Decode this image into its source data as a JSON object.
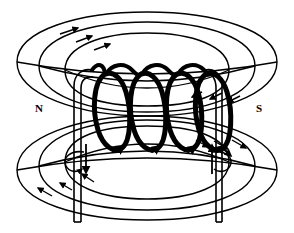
{
  "diagram": {
    "background_color": "#ffffff",
    "line_color": "#000000",
    "labels": {
      "north_pole": "N",
      "south_pole": "S"
    },
    "label_positions": {
      "north_pole": {
        "x": 39,
        "y": 112
      },
      "south_pole": {
        "x": 259,
        "y": 112
      }
    },
    "solenoid": {
      "turn_count": 4,
      "turn_centers_x": [
        114,
        150,
        186,
        222
      ],
      "turn_center_y": 112,
      "turn_rx": 17,
      "turn_ry": 41,
      "coil_stroke_width": 5,
      "core_rungs": 7
    },
    "leads": {
      "left_lead_x": 78,
      "right_lead_x": 219,
      "top_y": 72,
      "bottom_y": 222,
      "stroke_width": 2
    },
    "current_arrows": [
      {
        "name": "left-lead-current-arrow",
        "direction": "down",
        "x": 86,
        "y_start": 144,
        "y_end": 174
      },
      {
        "name": "right-lead-current-arrow",
        "direction": "up",
        "x": 212,
        "y_start": 174,
        "y_end": 144
      }
    ],
    "field_lines": {
      "upper_count": 3,
      "lower_count": 3,
      "upper_arrow_direction": "clockwise-right",
      "lower_arrow_direction": "counterclockwise-left",
      "upper_rings": [
        {
          "cx": 147,
          "cy": 62,
          "rx": 132,
          "ry": 52
        },
        {
          "cx": 147,
          "cy": 66,
          "rx": 108,
          "ry": 43
        },
        {
          "cx": 147,
          "cy": 70,
          "rx": 82,
          "ry": 33
        }
      ],
      "lower_rings": [
        {
          "cx": 147,
          "cy": 170,
          "rx": 132,
          "ry": 52
        },
        {
          "cx": 147,
          "cy": 166,
          "rx": 108,
          "ry": 43
        },
        {
          "cx": 147,
          "cy": 162,
          "rx": 82,
          "ry": 33
        }
      ]
    }
  }
}
